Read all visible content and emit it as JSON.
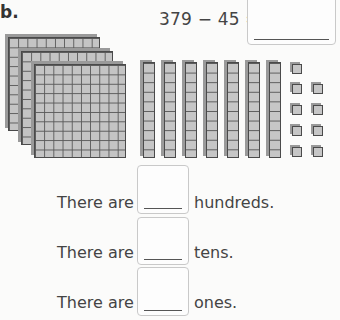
{
  "problem": {
    "label": "b.",
    "equation": "379 − 45 =",
    "answer": ""
  },
  "blocks": {
    "hundreds": 3,
    "tens": 7,
    "ones": 9
  },
  "rows": [
    {
      "prefix": "There are",
      "answer": "",
      "unit": "hundreds."
    },
    {
      "prefix": "There are",
      "answer": "",
      "unit": "tens."
    },
    {
      "prefix": "There are",
      "answer": "",
      "unit": "ones."
    }
  ],
  "colors": {
    "block_fill": "#c6c6c6",
    "block_line": "#4a4a4a",
    "text": "#444444",
    "box_border": "#c9c9c9"
  }
}
